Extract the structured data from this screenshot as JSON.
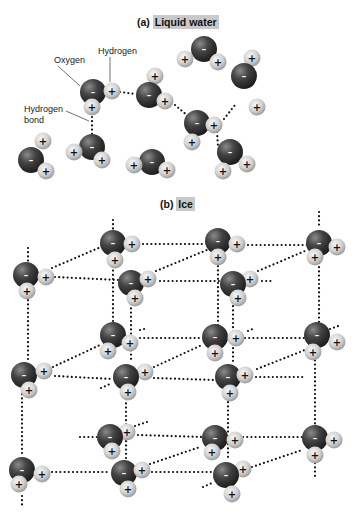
{
  "panel_a": {
    "title_prefix": "(a)",
    "title": "Liquid water",
    "labels": {
      "oxygen": "Oxygen",
      "hydrogen": "Hydrogen",
      "hydrogen_bond_line1": "Hydrogen",
      "hydrogen_bond_line2": "bond"
    }
  },
  "panel_b": {
    "title_prefix": "(b)",
    "title": "Ice"
  },
  "symbols": {
    "oxygen_charge": "–",
    "hydrogen_charge": "+"
  },
  "colors": {
    "oxygen": "#3a3a3a",
    "hydrogen": "#cfcfcf",
    "title_highlight": "#c9c9c9",
    "bond": "#111111"
  },
  "molecules_a": [
    {
      "o": [
        93,
        92
      ],
      "h": [
        [
          112,
          91
        ],
        [
          92,
          107
        ]
      ]
    },
    {
      "o": [
        149,
        95
      ],
      "h": [
        [
          155,
          76
        ],
        [
          165,
          101
        ]
      ]
    },
    {
      "o": [
        204,
        49
      ],
      "h": [
        [
          185,
          59
        ],
        [
          218,
          62
        ]
      ]
    },
    {
      "o": [
        197,
        123
      ],
      "h": [
        [
          214,
          125
        ],
        [
          192,
          142
        ]
      ]
    },
    {
      "o": [
        244,
        76
      ],
      "h": [
        [
          252,
          58
        ],
        [
          257,
          107
        ]
      ]
    },
    {
      "o": [
        92,
        147
      ],
      "h": [
        [
          74,
          152
        ],
        [
          102,
          160
        ]
      ]
    },
    {
      "o": [
        31,
        160
      ],
      "h": [
        [
          43,
          141
        ],
        [
          46,
          171
        ]
      ]
    },
    {
      "o": [
        152,
        162
      ],
      "h": [
        [
          134,
          165
        ],
        [
          167,
          170
        ]
      ]
    },
    {
      "o": [
        230,
        152
      ],
      "h": [
        [
          223,
          171
        ],
        [
          247,
          164
        ]
      ]
    }
  ],
  "bonds_a": [
    [
      [
        120,
        92
      ],
      [
        136,
        94
      ]
    ],
    [
      [
        175,
        105
      ],
      [
        189,
        117
      ]
    ],
    [
      [
        224,
        119
      ],
      [
        235,
        105
      ]
    ],
    [
      [
        217,
        132
      ],
      [
        218,
        146
      ]
    ],
    [
      [
        92,
        117
      ],
      [
        92,
        134
      ]
    ]
  ],
  "molecules_b": [
    {
      "o": [
        113,
        243
      ],
      "h": [
        [
          132,
          244
        ],
        [
          115,
          260
        ]
      ]
    },
    {
      "o": [
        218,
        241
      ],
      "h": [
        [
          237,
          244
        ],
        [
          218,
          257
        ]
      ]
    },
    {
      "o": [
        319,
        243
      ],
      "h": [
        [
          337,
          247
        ],
        [
          315,
          257
        ]
      ]
    },
    {
      "o": [
        26,
        275
      ],
      "h": [
        [
          46,
          277
        ],
        [
          27,
          291
        ]
      ]
    },
    {
      "o": [
        131,
        283
      ],
      "h": [
        [
          148,
          279
        ],
        [
          135,
          298
        ]
      ]
    },
    {
      "o": [
        233,
        284
      ],
      "h": [
        [
          250,
          279
        ],
        [
          238,
          298
        ]
      ]
    },
    {
      "o": [
        113,
        335
      ],
      "h": [
        [
          130,
          343
        ],
        [
          108,
          351
        ]
      ]
    },
    {
      "o": [
        215,
        337
      ],
      "h": [
        [
          236,
          338
        ],
        [
          215,
          353
        ]
      ]
    },
    {
      "o": [
        317,
        335
      ],
      "h": [
        [
          337,
          342
        ],
        [
          313,
          352
        ]
      ]
    },
    {
      "o": [
        24,
        375
      ],
      "h": [
        [
          44,
          371
        ],
        [
          29,
          390
        ]
      ]
    },
    {
      "o": [
        126,
        377
      ],
      "h": [
        [
          145,
          372
        ],
        [
          128,
          392
        ]
      ]
    },
    {
      "o": [
        228,
        377
      ],
      "h": [
        [
          245,
          375
        ],
        [
          230,
          393
        ]
      ]
    },
    {
      "o": [
        110,
        437
      ],
      "h": [
        [
          127,
          432
        ],
        [
          112,
          451
        ]
      ]
    },
    {
      "o": [
        215,
        438
      ],
      "h": [
        [
          235,
          440
        ],
        [
          212,
          452
        ]
      ]
    },
    {
      "o": [
        315,
        438
      ],
      "h": [
        [
          334,
          440
        ],
        [
          315,
          455
        ]
      ]
    },
    {
      "o": [
        22,
        470
      ],
      "h": [
        [
          42,
          474
        ],
        [
          19,
          484
        ]
      ]
    },
    {
      "o": [
        124,
        473
      ],
      "h": [
        [
          142,
          470
        ],
        [
          128,
          489
        ]
      ]
    },
    {
      "o": [
        226,
        475
      ],
      "h": [
        [
          243,
          469
        ],
        [
          232,
          494
        ]
      ]
    }
  ],
  "bonds_b": [
    [
      [
        143,
        244
      ],
      [
        205,
        244
      ]
    ],
    [
      [
        248,
        245
      ],
      [
        307,
        245
      ]
    ],
    [
      [
        55,
        277
      ],
      [
        118,
        280
      ]
    ],
    [
      [
        160,
        281
      ],
      [
        222,
        281
      ]
    ],
    [
      [
        262,
        281
      ],
      [
        273,
        281
      ]
    ],
    [
      [
        52,
        268
      ],
      [
        101,
        247
      ]
    ],
    [
      [
        156,
        271
      ],
      [
        207,
        250
      ]
    ],
    [
      [
        258,
        271
      ],
      [
        305,
        251
      ]
    ],
    [
      [
        113,
        220
      ],
      [
        113,
        230
      ]
    ],
    [
      [
        319,
        212
      ],
      [
        319,
        228
      ]
    ],
    [
      [
        28,
        248
      ],
      [
        28,
        262
      ]
    ],
    [
      [
        113,
        258
      ],
      [
        113,
        322
      ]
    ],
    [
      [
        218,
        262
      ],
      [
        218,
        325
      ]
    ],
    [
      [
        319,
        263
      ],
      [
        319,
        322
      ]
    ],
    [
      [
        28,
        296
      ],
      [
        28,
        360
      ]
    ],
    [
      [
        131,
        300
      ],
      [
        131,
        362
      ]
    ],
    [
      [
        233,
        302
      ],
      [
        233,
        363
      ]
    ],
    [
      [
        140,
        338
      ],
      [
        202,
        338
      ]
    ],
    [
      [
        245,
        338
      ],
      [
        305,
        338
      ]
    ],
    [
      [
        140,
        330
      ],
      [
        148,
        328
      ]
    ],
    [
      [
        248,
        331
      ],
      [
        255,
        328
      ]
    ],
    [
      [
        330,
        329
      ],
      [
        341,
        325
      ]
    ],
    [
      [
        55,
        376
      ],
      [
        112,
        379
      ]
    ],
    [
      [
        154,
        378
      ],
      [
        214,
        380
      ]
    ],
    [
      [
        256,
        377
      ],
      [
        303,
        377
      ]
    ],
    [
      [
        53,
        367
      ],
      [
        100,
        345
      ]
    ],
    [
      [
        154,
        367
      ],
      [
        202,
        345
      ]
    ],
    [
      [
        257,
        369
      ],
      [
        305,
        350
      ]
    ],
    [
      [
        22,
        390
      ],
      [
        22,
        455
      ]
    ],
    [
      [
        126,
        395
      ],
      [
        126,
        460
      ]
    ],
    [
      [
        228,
        398
      ],
      [
        228,
        460
      ]
    ],
    [
      [
        315,
        352
      ],
      [
        315,
        425
      ]
    ],
    [
      [
        80,
        437
      ],
      [
        97,
        437
      ]
    ],
    [
      [
        138,
        435
      ],
      [
        202,
        437
      ]
    ],
    [
      [
        243,
        437
      ],
      [
        302,
        437
      ]
    ],
    [
      [
        135,
        426
      ],
      [
        147,
        422
      ]
    ],
    [
      [
        52,
        472
      ],
      [
        110,
        472
      ]
    ],
    [
      [
        152,
        472
      ],
      [
        213,
        472
      ]
    ],
    [
      [
        150,
        464
      ],
      [
        200,
        447
      ]
    ],
    [
      [
        252,
        467
      ],
      [
        302,
        450
      ]
    ],
    [
      [
        22,
        496
      ],
      [
        22,
        508
      ]
    ],
    [
      [
        315,
        459
      ],
      [
        315,
        478
      ]
    ],
    [
      [
        203,
        487
      ],
      [
        212,
        483
      ]
    ],
    [
      [
        101,
        388
      ],
      [
        110,
        384
      ]
    ]
  ]
}
